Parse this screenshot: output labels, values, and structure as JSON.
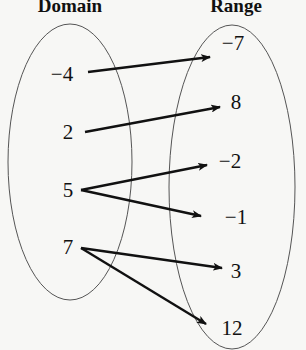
{
  "diagram": {
    "type": "mapping",
    "titles": {
      "domain": "Domain",
      "range": "Range"
    },
    "domain": [
      {
        "label": "−4",
        "x": 62,
        "y": 74
      },
      {
        "label": "2",
        "x": 68,
        "y": 132
      },
      {
        "label": "5",
        "x": 68,
        "y": 190
      },
      {
        "label": "7",
        "x": 68,
        "y": 247
      }
    ],
    "range": [
      {
        "label": "−7",
        "x": 233,
        "y": 43
      },
      {
        "label": "8",
        "x": 236,
        "y": 102
      },
      {
        "label": "−2",
        "x": 230,
        "y": 161
      },
      {
        "label": "−1",
        "x": 236,
        "y": 217
      },
      {
        "label": "3",
        "x": 236,
        "y": 271
      },
      {
        "label": "12",
        "x": 232,
        "y": 328
      }
    ],
    "mappings": [
      {
        "from": "−4",
        "to": "−7",
        "x1": 88,
        "y1": 72,
        "x2": 210,
        "y2": 57
      },
      {
        "from": "2",
        "to": "8",
        "x1": 85,
        "y1": 132,
        "x2": 220,
        "y2": 107
      },
      {
        "from": "5",
        "to": "−2",
        "x1": 81,
        "y1": 190,
        "x2": 207,
        "y2": 165
      },
      {
        "from": "5",
        "to": "−1",
        "x1": 81,
        "y1": 190,
        "x2": 201,
        "y2": 216
      },
      {
        "from": "7",
        "to": "3",
        "x1": 81,
        "y1": 248,
        "x2": 222,
        "y2": 268
      },
      {
        "from": "7",
        "to": "12",
        "x1": 81,
        "y1": 248,
        "x2": 206,
        "y2": 324
      }
    ],
    "ellipses": {
      "domain": {
        "cx": 70,
        "cy": 162,
        "rx": 62,
        "ry": 138
      },
      "range": {
        "cx": 232,
        "cy": 187,
        "rx": 63,
        "ry": 162
      }
    },
    "colors": {
      "ink": "#111111",
      "outline": "#555555",
      "background": "#f7f7f5"
    }
  }
}
